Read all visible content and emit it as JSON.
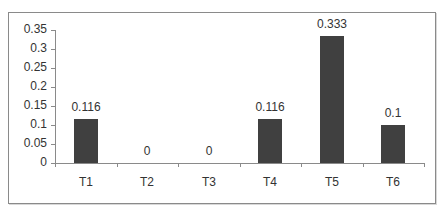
{
  "chart_data": {
    "type": "bar",
    "title": "",
    "xlabel": "",
    "ylabel": "",
    "categories": [
      "T1",
      "T2",
      "T3",
      "T4",
      "T5",
      "T6"
    ],
    "values": [
      0.116,
      0,
      0,
      0.116,
      0.333,
      0.1
    ],
    "data_labels": [
      "0.116",
      "0",
      "0",
      "0.116",
      "0.333",
      "0.1"
    ],
    "ylim": [
      0,
      0.35
    ],
    "yticks": [
      "0",
      "0.05",
      "0.1",
      "0.15",
      "0.2",
      "0.25",
      "0.3",
      "0.35"
    ],
    "grid": false,
    "legend": null,
    "bar_color": "#404040"
  }
}
